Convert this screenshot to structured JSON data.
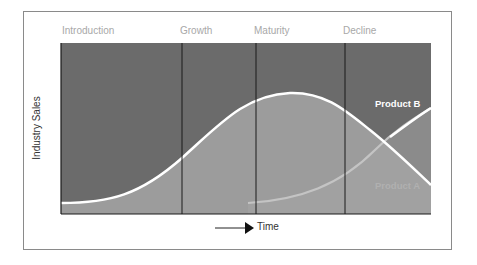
{
  "diagram": {
    "stages": [
      {
        "label": "Introduction",
        "x": 62
      },
      {
        "label": "Growth",
        "x": 180
      },
      {
        "label": "Maturity",
        "x": 254
      },
      {
        "label": "Decline",
        "x": 343
      }
    ],
    "y_axis_label": "Industry Sales",
    "x_axis_label": "Time",
    "curves": [
      {
        "name": "Product A",
        "label_color": "#b0b0b0",
        "shape": "bell"
      },
      {
        "name": "Product B",
        "label_color": "#ffffff",
        "shape": "rising"
      }
    ],
    "colors": {
      "plot_background": "#6b6b6b",
      "area_fill": "#9c9c9c",
      "curve_stroke": "#ffffff",
      "divider": "#1a1a1a",
      "stage_label": "#a8a8a8"
    }
  }
}
